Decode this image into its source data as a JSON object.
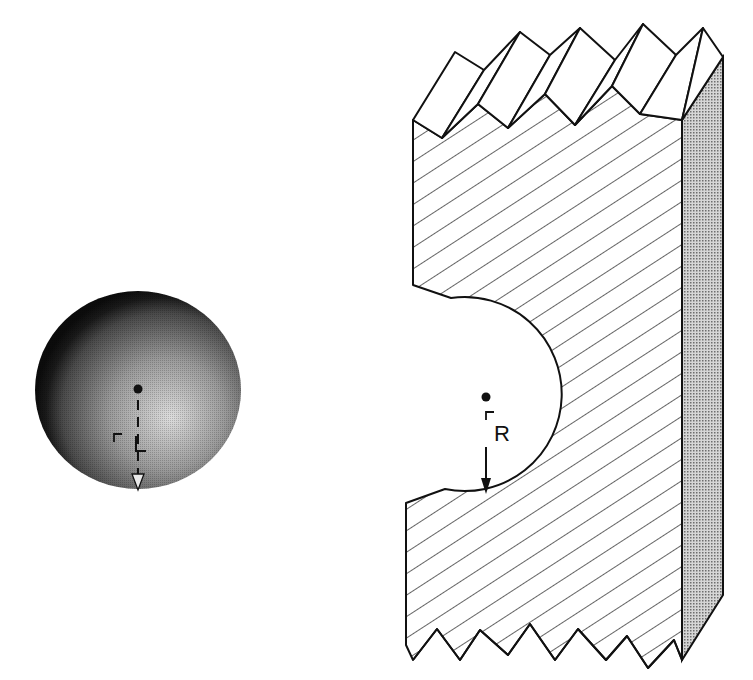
{
  "diagram": {
    "type": "technical-illustration",
    "sphere": {
      "label": "L",
      "label_prefix": "⌐",
      "center": [
        138,
        389
      ],
      "radius": 103,
      "shading": "radial gradient, dark rim to light center-right"
    },
    "block": {
      "cavity_label": "R",
      "cavity_label_prefix": "⌐",
      "cavity_center": [
        486,
        397
      ],
      "cavity_radius": 97,
      "front_fill": "diagonal hatching",
      "side_fill": "stippled gray",
      "edges": "jagged (broken) top and bottom"
    }
  },
  "colors": {
    "stroke": "#111111",
    "side_face": "#b8b8b8",
    "sphere_dark": "#111111",
    "sphere_light": "#d8d8d8",
    "background": "#ffffff"
  }
}
